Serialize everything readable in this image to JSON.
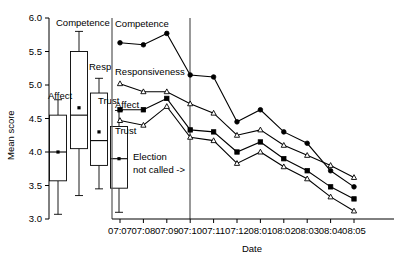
{
  "chart_data": {
    "type": "line",
    "title": "",
    "xlabel": "Date",
    "ylabel": "Mean score",
    "ylim": [
      3.0,
      6.0
    ],
    "ytick_labels": [
      "3.0",
      "3.5",
      "4.0",
      "4.5",
      "5.0",
      "5.5",
      "6.0"
    ],
    "ytick_values": [
      3.0,
      3.5,
      4.0,
      4.5,
      5.0,
      5.5,
      6.0
    ],
    "grid": false,
    "legend_position": "inline-labels",
    "categories": [
      "07:07",
      "07:08",
      "07:09",
      "07:10",
      "07:11",
      "07:12",
      "08:01",
      "08:02",
      "08:03",
      "08:04",
      "08:05"
    ],
    "series": [
      {
        "name": "Competence",
        "marker": "filled-circle",
        "values": [
          5.63,
          5.6,
          5.77,
          5.15,
          5.12,
          4.45,
          4.63,
          4.3,
          4.13,
          3.72,
          3.48
        ]
      },
      {
        "name": "Responsiveness",
        "marker": "open-triangle",
        "values": [
          5.02,
          4.9,
          4.9,
          4.72,
          4.58,
          4.25,
          4.33,
          4.1,
          3.95,
          3.8,
          3.62
        ]
      },
      {
        "name": "Affect",
        "marker": "filled-square",
        "values": [
          4.63,
          4.63,
          4.8,
          4.33,
          4.3,
          4.0,
          4.15,
          3.9,
          3.72,
          3.48,
          3.3
        ]
      },
      {
        "name": "Trust",
        "marker": "open-triangle",
        "values": [
          4.47,
          4.4,
          4.68,
          4.22,
          4.17,
          3.83,
          4.0,
          3.78,
          3.6,
          3.33,
          3.12
        ]
      }
    ],
    "annotations": [
      {
        "id": "election-note",
        "text_line1": "Election",
        "text_line2": "not called ->"
      }
    ],
    "boxplots": {
      "panel_label": "distribution-panel",
      "items": [
        {
          "name": "Affect",
          "lower_whisker": 3.07,
          "q1": 3.57,
          "median": 4.0,
          "q3": 4.55,
          "upper_whisker": 4.78,
          "mean": 4.0
        },
        {
          "name": "Competence",
          "lower_whisker": 3.35,
          "q1": 4.05,
          "median": 4.55,
          "q3": 5.5,
          "upper_whisker": 5.8,
          "mean": 4.66
        },
        {
          "name": "Resp",
          "lower_whisker": 3.45,
          "q1": 3.8,
          "median": 4.17,
          "q3": 4.88,
          "upper_whisker": 5.1,
          "mean": 4.3
        },
        {
          "name": "Trust",
          "lower_whisker": 3.1,
          "q1": 3.46,
          "median": 3.9,
          "q3": 4.38,
          "upper_whisker": 4.62,
          "mean": 3.9
        }
      ]
    }
  },
  "axes": {
    "y_title": "Mean score",
    "x_title": "Date"
  },
  "colors": {
    "ink": "#000000",
    "divider": "#555555",
    "background": "#ffffff"
  }
}
